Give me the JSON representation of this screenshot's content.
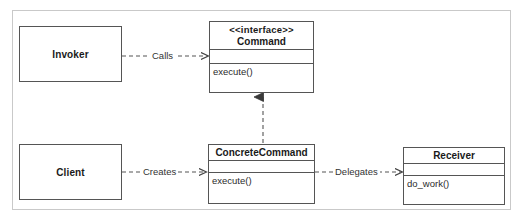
{
  "diagram": {
    "kind": "uml-class-diagram",
    "colors": {
      "node_border": "#555555",
      "frame_border": "#c9c9c9",
      "edge": "#555555",
      "text": "#1a1a1a",
      "background": "#ffffff"
    },
    "nodes": [
      {
        "id": "invoker",
        "label": "Invoker",
        "style": "plain"
      },
      {
        "id": "client",
        "label": "Client",
        "style": "plain"
      },
      {
        "id": "command",
        "stereotype": "<<interface>>",
        "label": "Command",
        "attributes": [],
        "operations": [
          "execute()"
        ],
        "style": "class"
      },
      {
        "id": "concrete_command",
        "stereotype": "",
        "label": "ConcreteCommand",
        "attributes": [],
        "operations": [
          "execute()"
        ],
        "style": "class"
      },
      {
        "id": "receiver",
        "stereotype": "",
        "label": "Receiver",
        "attributes": [],
        "operations": [
          "do_work()"
        ],
        "style": "class"
      }
    ],
    "edges": [
      {
        "id": "calls",
        "label": "Calls",
        "from": "invoker",
        "to": "command",
        "line": "dashed",
        "arrow": "open"
      },
      {
        "id": "creates",
        "label": "Creates",
        "from": "client",
        "to": "concrete_command",
        "line": "dashed",
        "arrow": "open"
      },
      {
        "id": "delegates",
        "label": "Delegates",
        "from": "concrete_command",
        "to": "receiver",
        "line": "dashed",
        "arrow": "open"
      },
      {
        "id": "realizes",
        "label": "",
        "from": "concrete_command",
        "to": "command",
        "line": "dashed",
        "arrow": "closed-triangle"
      }
    ]
  }
}
